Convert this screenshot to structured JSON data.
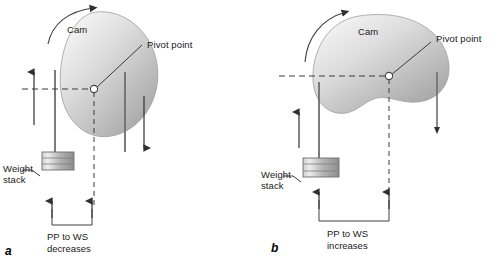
{
  "figure": {
    "type": "mechanical-diagram",
    "panels": [
      {
        "id": "a",
        "letter": "a",
        "cam_label": "Cam",
        "pivot_label": "Pivot point",
        "weight_stack_label": "Weight\nstack",
        "caption": "PP to WS\ndecreases",
        "cam_shape": "oval-tilted",
        "rotation_direction": "clockwise",
        "cable_arrow_left": "up",
        "cable_arrow_right": "down",
        "dimension": "narrow"
      },
      {
        "id": "b",
        "letter": "b",
        "cam_label": "Cam",
        "pivot_label": "Pivot point",
        "weight_stack_label": "Weight\nstack",
        "caption": "PP to WS\nincreases",
        "cam_shape": "kidney",
        "rotation_direction": "clockwise",
        "cable_arrow_left": "up",
        "cable_arrow_right": "down",
        "dimension": "wide"
      }
    ]
  },
  "colors": {
    "line": "#404040",
    "text": "#1a1a1a",
    "cam_light": "#f2f2f2",
    "cam_mid": "#c9c9c9",
    "cam_dark": "#9a9a9a",
    "weight_light": "#e8e8e8",
    "weight_dark": "#8f8f8f",
    "background": "#ffffff"
  }
}
